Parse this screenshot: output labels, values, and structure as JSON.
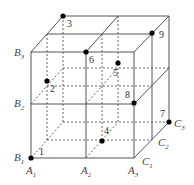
{
  "diagram": {
    "type": "3x3x3 cube lattice (2x2x2 cells) with numbered points",
    "axis_labels": {
      "A": [
        {
          "name": "A",
          "sub": "1"
        },
        {
          "name": "A",
          "sub": "2"
        },
        {
          "name": "A",
          "sub": "3"
        }
      ],
      "B": [
        {
          "name": "B",
          "sub": "1"
        },
        {
          "name": "B",
          "sub": "2"
        },
        {
          "name": "B",
          "sub": "3"
        }
      ],
      "C": [
        {
          "name": "C",
          "sub": "1"
        },
        {
          "name": "C",
          "sub": "2"
        },
        {
          "name": "C",
          "sub": "3"
        }
      ]
    },
    "points": [
      {
        "label": "1"
      },
      {
        "label": "2"
      },
      {
        "label": "3"
      },
      {
        "label": "4"
      },
      {
        "label": "5"
      },
      {
        "label": "6"
      },
      {
        "label": "7"
      },
      {
        "label": "8"
      },
      {
        "label": "9"
      }
    ],
    "colors": {
      "line": "#555555",
      "point": "#000000",
      "text": "#444444"
    }
  }
}
